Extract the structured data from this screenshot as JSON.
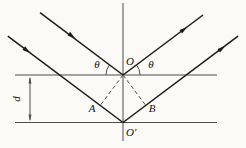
{
  "figure": {
    "labels": {
      "angle_left": "θ",
      "angle_right": "θ",
      "point_o": "O",
      "point_o_prime": "O′",
      "point_a": "A",
      "point_b": "B",
      "spacing_d": "d"
    },
    "colors": {
      "background": "#fbfaf7",
      "construction_line": "#4d4d4d",
      "ray_line": "#1a1a1a",
      "label_text": "#111111"
    }
  }
}
